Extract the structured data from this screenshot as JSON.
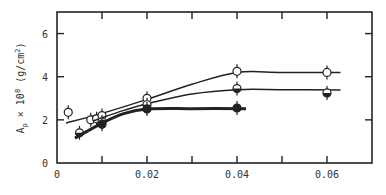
{
  "chart_data": {
    "type": "scatter",
    "title": "",
    "xlabel": "",
    "ylabel": "A_p × 10^8 (g/cm²)",
    "ylabel_parts": {
      "base": "A",
      "sub": "p",
      "mult": " × 10",
      "exp": "8",
      "unit": "(g/cm",
      "unit_exp": "2",
      "unit_close": ")"
    },
    "xlim": [
      0,
      0.07
    ],
    "ylim": [
      0,
      7
    ],
    "x_ticks": [
      0,
      0.01,
      0.02,
      0.03,
      0.04,
      0.05,
      0.06
    ],
    "x_tick_labels": [
      "0",
      "",
      "0.02",
      "",
      "0.04",
      "",
      "0.06"
    ],
    "y_ticks": [
      0,
      2,
      4,
      6
    ],
    "y_tick_labels": [
      "0",
      "2",
      "4",
      "6"
    ],
    "grid": false,
    "legend": null,
    "series": [
      {
        "name": "open-circles",
        "marker": "open",
        "points": [
          [
            0.0025,
            2.35
          ],
          [
            0.0075,
            2.0
          ],
          [
            0.0088,
            2.05
          ],
          [
            0.01,
            2.2
          ],
          [
            0.02,
            3.0
          ],
          [
            0.04,
            4.25
          ],
          [
            0.06,
            4.2
          ]
        ],
        "curve": [
          [
            0.002,
            1.85
          ],
          [
            0.01,
            2.3
          ],
          [
            0.02,
            2.95
          ],
          [
            0.03,
            3.65
          ],
          [
            0.04,
            4.2
          ],
          [
            0.05,
            4.2
          ],
          [
            0.063,
            4.2
          ]
        ]
      },
      {
        "name": "half-filled",
        "marker": "half",
        "points": [
          [
            0.005,
            1.4
          ],
          [
            0.01,
            1.9
          ],
          [
            0.02,
            2.7
          ],
          [
            0.04,
            3.45
          ],
          [
            0.06,
            3.25
          ]
        ],
        "curve": [
          [
            0.008,
            1.95
          ],
          [
            0.015,
            2.45
          ],
          [
            0.02,
            2.75
          ],
          [
            0.03,
            3.2
          ],
          [
            0.04,
            3.4
          ],
          [
            0.05,
            3.4
          ],
          [
            0.063,
            3.38
          ]
        ]
      },
      {
        "name": "filled-thick",
        "marker": "filled",
        "points": [
          [
            0.01,
            1.8
          ],
          [
            0.02,
            2.5
          ],
          [
            0.04,
            2.55
          ]
        ],
        "curve": [
          [
            0.004,
            1.15
          ],
          [
            0.01,
            1.85
          ],
          [
            0.015,
            2.3
          ],
          [
            0.02,
            2.5
          ],
          [
            0.03,
            2.52
          ],
          [
            0.042,
            2.52
          ]
        ]
      }
    ]
  }
}
